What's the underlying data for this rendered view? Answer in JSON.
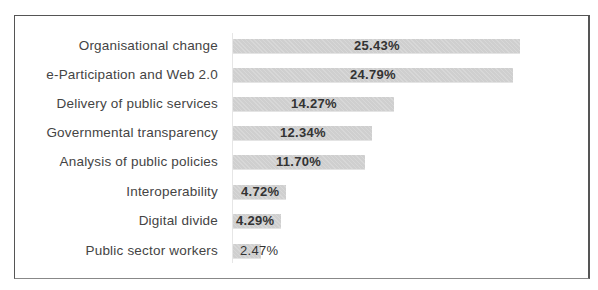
{
  "chart_data": {
    "type": "bar",
    "orientation": "horizontal",
    "title": "",
    "xlabel": "",
    "ylabel": "",
    "categories": [
      "Organisational change",
      "e-Participation and Web 2.0",
      "Delivery of public services",
      "Governmental transparency",
      "Analysis of public policies",
      "Interoperability",
      "Digital divide",
      "Public sector workers"
    ],
    "values": [
      25.43,
      24.79,
      14.27,
      12.34,
      11.7,
      4.72,
      4.29,
      2.47
    ],
    "value_labels": [
      "25.43%",
      "24.79%",
      "14.27%",
      "12.34%",
      "11.70%",
      "4.72%",
      "4.29%",
      "2.47%"
    ],
    "unit": "%",
    "grid": false,
    "legend": null,
    "bar_color": "#cfcfcf"
  }
}
